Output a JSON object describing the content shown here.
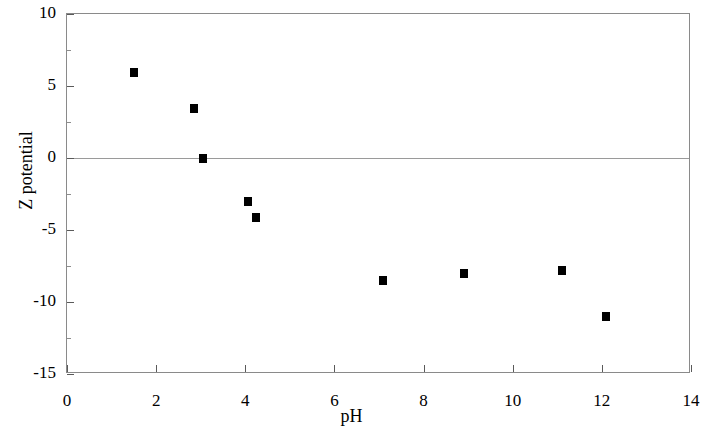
{
  "chart_data": {
    "type": "scatter",
    "title": "",
    "xlabel": "pH",
    "ylabel": "Z potential",
    "xlim": [
      0,
      14
    ],
    "ylim": [
      -15,
      10
    ],
    "xticks": [
      0,
      2,
      4,
      6,
      8,
      10,
      12,
      14
    ],
    "xtick_labels": [
      "0",
      "2",
      "4",
      "6",
      "8",
      "10",
      "12",
      "14"
    ],
    "yticks": [
      10,
      5,
      0,
      -5,
      -10,
      -15
    ],
    "ytick_labels": [
      "10",
      "5",
      "0",
      "-5",
      "-10",
      "-15"
    ],
    "y_minor_ticks": [
      7.5,
      2.5,
      -2.5,
      -7.5,
      -12.5
    ],
    "grid": false,
    "zero_line": true,
    "legend": null,
    "marker": "filled-square",
    "marker_color": "#000000",
    "series": [
      {
        "name": "Z potential vs pH",
        "points": [
          {
            "x": 1.5,
            "y": 6.0
          },
          {
            "x": 2.85,
            "y": 3.5
          },
          {
            "x": 3.05,
            "y": 0.0
          },
          {
            "x": 4.05,
            "y": -3.0
          },
          {
            "x": 4.25,
            "y": -4.1
          },
          {
            "x": 7.1,
            "y": -8.5
          },
          {
            "x": 8.9,
            "y": -8.0
          },
          {
            "x": 11.1,
            "y": -7.8
          },
          {
            "x": 12.1,
            "y": -11.0
          }
        ]
      }
    ]
  },
  "axes": {
    "frame_color": "#8a8a8a",
    "zero_line_color": "#9a9a9a"
  }
}
